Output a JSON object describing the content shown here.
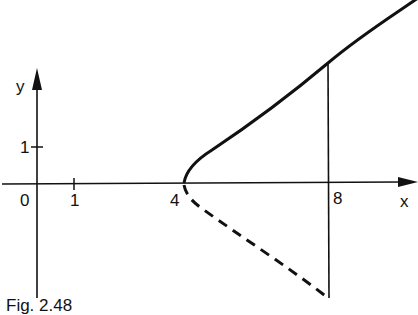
{
  "figure": {
    "caption": "Fig. 2.48",
    "axes": {
      "x_label": "x",
      "y_label": "y",
      "origin_label": "0",
      "x_ticks": [
        "1",
        "4",
        "8"
      ],
      "y_ticks": [
        "1"
      ]
    },
    "curves": [
      {
        "name": "upper-branch",
        "style": "solid",
        "description": "curve starting at (4,0) rising through x=8"
      },
      {
        "name": "lower-branch",
        "style": "dashed",
        "description": "mirror curve below x-axis from (4,0) to x=8"
      }
    ],
    "vertical_line": {
      "x": "8",
      "style": "solid"
    }
  }
}
